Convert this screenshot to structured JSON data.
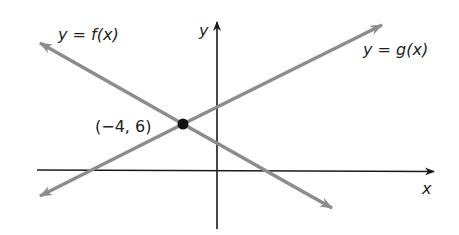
{
  "diagram": {
    "type": "coordinate-plane",
    "axes": {
      "x_label": "x",
      "y_label": "y",
      "color": "#1a1a1a"
    },
    "lines": [
      {
        "id": "f",
        "label": "y = f(x)",
        "slope_sign": "negative",
        "color": "#8c8c8c"
      },
      {
        "id": "g",
        "label": "y = g(x)",
        "slope_sign": "positive",
        "color": "#8c8c8c"
      }
    ],
    "intersection": {
      "label": "(−4, 6)",
      "x": -4,
      "y": 6,
      "color": "#111111"
    }
  }
}
